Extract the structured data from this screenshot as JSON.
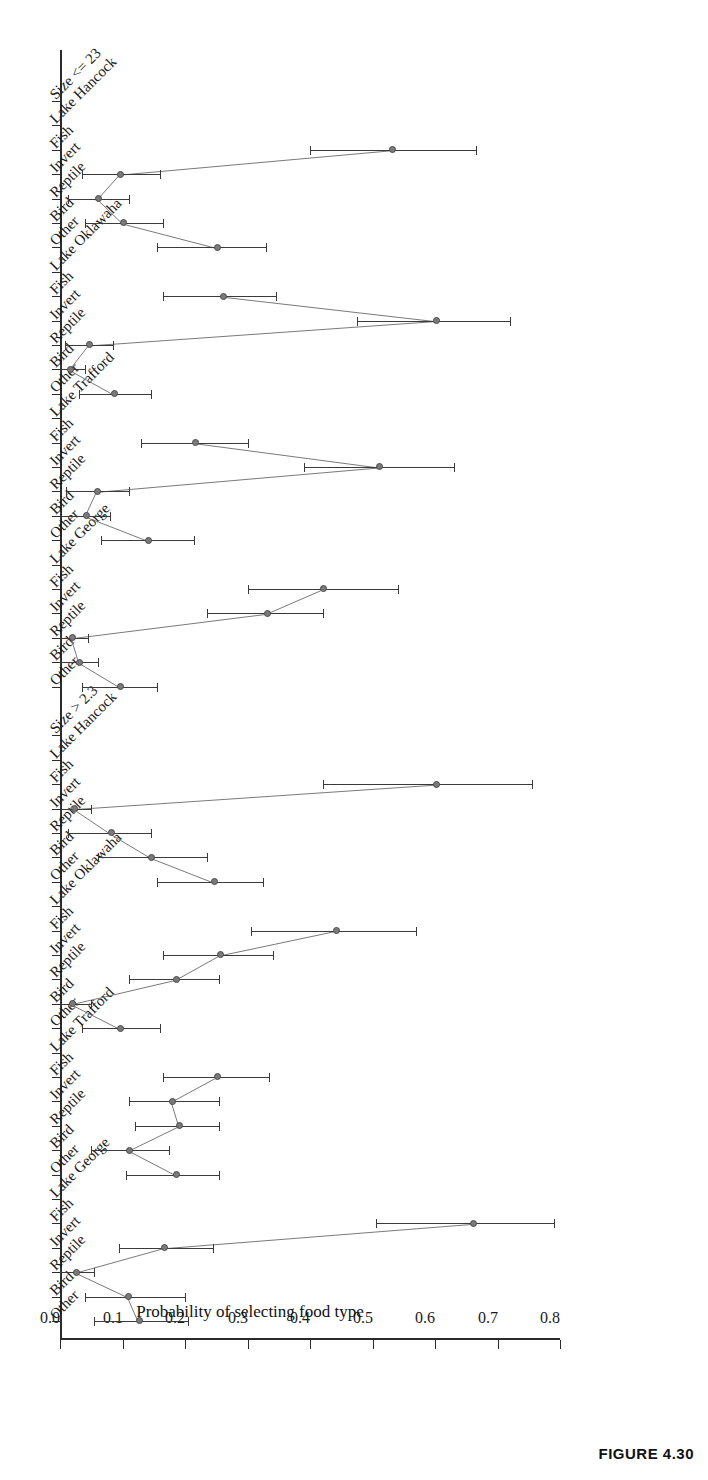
{
  "figure": {
    "caption": "FIGURE 4.30"
  },
  "chart_data": {
    "type": "scatter",
    "title": "",
    "xlabel": "",
    "ylabel": "Probability of selecting food type",
    "ylim": [
      0.0,
      0.8
    ],
    "yticks": [
      "0.0",
      "0.1",
      "0.2",
      "0.3",
      "0.4",
      "0.5",
      "0.6",
      "0.7",
      "0.8"
    ],
    "ytick_values": [
      0.0,
      0.1,
      0.2,
      0.3,
      0.4,
      0.5,
      0.6,
      0.7,
      0.8
    ],
    "grid": false,
    "legend": "none",
    "orientation": "rotated-90",
    "error_bars": "95% confidence interval",
    "food_types": [
      "Other",
      "Bird",
      "Reptile",
      "Invert",
      "Fish"
    ],
    "section_labels": [
      "Size > 2.3",
      "Size <= 23"
    ],
    "sections": [
      {
        "label": "Size > 2.3",
        "groups": [
          {
            "lake": "Lake George",
            "points": [
              {
                "category": "Other",
                "value": 0.125,
                "low": 0.055,
                "high": 0.205
              },
              {
                "category": "Bird",
                "value": 0.108,
                "low": 0.04,
                "high": 0.2
              },
              {
                "category": "Reptile",
                "value": 0.025,
                "low": 0.0,
                "high": 0.055
              },
              {
                "category": "Invert",
                "value": 0.165,
                "low": 0.095,
                "high": 0.245
              },
              {
                "category": "Fish",
                "value": 0.66,
                "low": 0.505,
                "high": 0.79
              }
            ]
          },
          {
            "lake": "Lake Trafford",
            "points": [
              {
                "category": "Other",
                "value": 0.185,
                "low": 0.105,
                "high": 0.255
              },
              {
                "category": "Bird",
                "value": 0.11,
                "low": 0.05,
                "high": 0.175
              },
              {
                "category": "Reptile",
                "value": 0.19,
                "low": 0.12,
                "high": 0.255
              },
              {
                "category": "Invert",
                "value": 0.178,
                "low": 0.11,
                "high": 0.255
              },
              {
                "category": "Fish",
                "value": 0.25,
                "low": 0.165,
                "high": 0.335
              }
            ]
          },
          {
            "lake": "Lake Oklawaha",
            "points": [
              {
                "category": "Other",
                "value": 0.095,
                "low": 0.035,
                "high": 0.16
              },
              {
                "category": "Bird",
                "value": 0.018,
                "low": 0.0,
                "high": 0.05
              },
              {
                "category": "Reptile",
                "value": 0.185,
                "low": 0.11,
                "high": 0.255
              },
              {
                "category": "Invert",
                "value": 0.255,
                "low": 0.165,
                "high": 0.34
              },
              {
                "category": "Fish",
                "value": 0.44,
                "low": 0.305,
                "high": 0.57
              }
            ]
          },
          {
            "lake": "Lake Hancock",
            "points": [
              {
                "category": "Other",
                "value": 0.245,
                "low": 0.155,
                "high": 0.325
              },
              {
                "category": "Bird",
                "value": 0.145,
                "low": 0.06,
                "high": 0.235
              },
              {
                "category": "Reptile",
                "value": 0.08,
                "low": 0.012,
                "high": 0.145
              },
              {
                "category": "Invert",
                "value": 0.022,
                "low": 0.0,
                "high": 0.05
              },
              {
                "category": "Fish",
                "value": 0.6,
                "low": 0.42,
                "high": 0.755
              }
            ]
          }
        ]
      },
      {
        "label": "Size <= 23",
        "groups": [
          {
            "lake": "Lake George",
            "points": [
              {
                "category": "Other",
                "value": 0.095,
                "low": 0.035,
                "high": 0.155
              },
              {
                "category": "Bird",
                "value": 0.03,
                "low": 0.0,
                "high": 0.06
              },
              {
                "category": "Reptile",
                "value": 0.018,
                "low": 0.0,
                "high": 0.045
              },
              {
                "category": "Invert",
                "value": 0.33,
                "low": 0.235,
                "high": 0.42
              },
              {
                "category": "Fish",
                "value": 0.42,
                "low": 0.3,
                "high": 0.54
              }
            ]
          },
          {
            "lake": "Lake Trafford",
            "points": [
              {
                "category": "Other",
                "value": 0.14,
                "low": 0.065,
                "high": 0.215
              },
              {
                "category": "Bird",
                "value": 0.04,
                "low": 0.0,
                "high": 0.08
              },
              {
                "category": "Reptile",
                "value": 0.058,
                "low": 0.01,
                "high": 0.11
              },
              {
                "category": "Invert",
                "value": 0.51,
                "low": 0.39,
                "high": 0.63
              },
              {
                "category": "Fish",
                "value": 0.215,
                "low": 0.13,
                "high": 0.3
              }
            ]
          },
          {
            "lake": "Lake Oklawaha",
            "points": [
              {
                "category": "Other",
                "value": 0.085,
                "low": 0.03,
                "high": 0.145
              },
              {
                "category": "Bird",
                "value": 0.015,
                "low": 0.0,
                "high": 0.04
              },
              {
                "category": "Reptile",
                "value": 0.045,
                "low": 0.008,
                "high": 0.085
              },
              {
                "category": "Invert",
                "value": 0.6,
                "low": 0.475,
                "high": 0.72
              },
              {
                "category": "Fish",
                "value": 0.26,
                "low": 0.165,
                "high": 0.345
              }
            ]
          },
          {
            "lake": "Lake Hancock",
            "points": [
              {
                "category": "Other",
                "value": 0.25,
                "low": 0.155,
                "high": 0.33
              },
              {
                "category": "Bird",
                "value": 0.1,
                "low": 0.04,
                "high": 0.165
              },
              {
                "category": "Reptile",
                "value": 0.06,
                "low": 0.012,
                "high": 0.11
              },
              {
                "category": "Invert",
                "value": 0.095,
                "low": 0.035,
                "high": 0.16
              },
              {
                "category": "Fish",
                "value": 0.53,
                "low": 0.4,
                "high": 0.665
              }
            ]
          }
        ]
      }
    ]
  },
  "colors": {
    "axis": "#2b2b2b",
    "marker": "#7a7a7a",
    "marker_edge": "#4a4a4a",
    "errorbar": "#3a3a3a",
    "text": "#1a1a1a"
  }
}
